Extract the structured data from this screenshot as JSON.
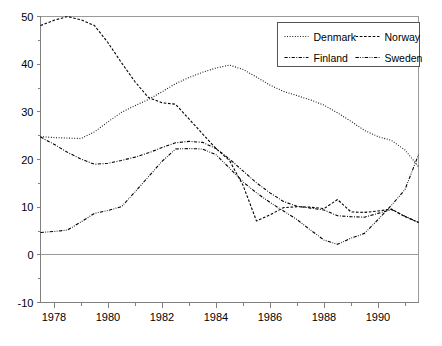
{
  "chart_data": {
    "type": "line",
    "title": "",
    "subtitle": "",
    "xlabel": "",
    "ylabel": "",
    "xlim": [
      1977.5,
      1991.5
    ],
    "ylim": [
      -10,
      50
    ],
    "yticks": [
      -10,
      0,
      10,
      20,
      30,
      40,
      50
    ],
    "ytick_labels": [
      "-10",
      "0",
      "10",
      "20",
      "30",
      "40",
      "50"
    ],
    "yminor_ticks": [
      -5,
      5,
      15,
      25,
      35,
      45
    ],
    "xticks": [
      1978,
      1979,
      1980,
      1981,
      1982,
      1983,
      1984,
      1985,
      1986,
      1987,
      1988,
      1989,
      1990,
      1991
    ],
    "xtick_labels_shown": [
      "1978",
      "1980",
      "1982",
      "1984",
      "1986",
      "1988",
      "1990"
    ],
    "xtick_labels_values": [
      1978,
      1980,
      1982,
      1984,
      1986,
      1988,
      1990
    ],
    "grid": false,
    "legend_position": "top-right",
    "zero_line": 0,
    "series": [
      {
        "name": "Denmark",
        "dash": "0.9 1.7",
        "x": [
          1977.5,
          1978.0,
          1978.5,
          1979.0,
          1979.5,
          1980.0,
          1980.5,
          1981.0,
          1981.5,
          1982.0,
          1982.5,
          1983.0,
          1983.5,
          1984.0,
          1984.5,
          1985.0,
          1985.5,
          1986.0,
          1986.5,
          1987.0,
          1987.5,
          1988.0,
          1988.5,
          1989.0,
          1989.5,
          1990.0,
          1990.5,
          1991.0,
          1991.5
        ],
        "values": [
          24.8,
          24.6,
          24.5,
          24.4,
          25.8,
          27.9,
          29.9,
          31.3,
          32.6,
          34.2,
          35.9,
          37.2,
          38.3,
          39.2,
          39.8,
          38.9,
          37.3,
          35.6,
          34.3,
          33.4,
          32.5,
          31.4,
          29.8,
          28.0,
          26.1,
          24.8,
          24.0,
          22.0,
          18.5
        ]
      },
      {
        "name": "Norway",
        "dash": "2.6 1.7",
        "x": [
          1977.5,
          1978.0,
          1978.5,
          1979.0,
          1979.5,
          1980.0,
          1980.5,
          1981.0,
          1981.5,
          1982.0,
          1982.5,
          1983.0,
          1983.5,
          1984.0,
          1984.5,
          1985.0,
          1985.5,
          1986.0,
          1986.5,
          1987.0,
          1987.5,
          1988.0,
          1988.5,
          1989.0,
          1989.5,
          1990.0,
          1990.5,
          1991.0,
          1991.5
        ],
        "values": [
          48.1,
          49.2,
          50.0,
          49.3,
          48.1,
          44.5,
          40.3,
          36.3,
          33.0,
          31.9,
          31.6,
          28.5,
          25.4,
          22.3,
          19.8,
          14.6,
          7.1,
          8.4,
          9.9,
          10.1,
          10.0,
          9.7,
          11.6,
          9.0,
          8.9,
          9.2,
          9.6,
          8.0,
          6.8
        ]
      },
      {
        "name": "Finland",
        "dash": "3.2 1.5 0.9 1.5",
        "x": [
          1977.5,
          1978.0,
          1978.5,
          1979.0,
          1979.5,
          1980.0,
          1980.5,
          1981.0,
          1981.5,
          1982.0,
          1982.5,
          1983.0,
          1983.5,
          1984.0,
          1984.5,
          1985.0,
          1985.5,
          1986.0,
          1986.5,
          1987.0,
          1987.5,
          1988.0,
          1988.5,
          1989.0,
          1989.5,
          1990.0,
          1990.5,
          1991.0,
          1991.5
        ],
        "values": [
          24.7,
          23.2,
          21.5,
          20.1,
          19.0,
          19.2,
          19.8,
          20.5,
          21.4,
          22.5,
          23.5,
          23.8,
          23.6,
          22.3,
          20.1,
          17.6,
          15.1,
          13.0,
          11.2,
          10.2,
          9.8,
          9.4,
          8.2,
          8.0,
          7.9,
          8.7,
          9.5,
          8.1,
          6.8
        ]
      },
      {
        "name": "Sweden",
        "dash": "3.4 1.4 0.8 1.4 0.8 1.4",
        "x": [
          1977.5,
          1978.0,
          1978.5,
          1979.0,
          1979.5,
          1980.0,
          1980.5,
          1981.0,
          1981.5,
          1982.0,
          1982.5,
          1983.0,
          1983.5,
          1984.0,
          1984.5,
          1985.0,
          1985.5,
          1986.0,
          1986.5,
          1987.0,
          1987.5,
          1988.0,
          1988.5,
          1989.0,
          1989.5,
          1990.0,
          1990.5,
          1991.0,
          1991.5
        ],
        "values": [
          4.7,
          4.9,
          5.2,
          6.9,
          8.7,
          9.3,
          10.1,
          13.2,
          16.4,
          19.6,
          22.2,
          22.3,
          22.2,
          21.0,
          18.2,
          15.3,
          13.0,
          11.0,
          9.2,
          7.4,
          5.2,
          3.1,
          2.2,
          3.5,
          4.5,
          7.4,
          10.4,
          13.7,
          21.0
        ]
      }
    ]
  },
  "legend": {
    "entries": [
      {
        "label": "Denmark"
      },
      {
        "label": "Norway"
      },
      {
        "label": "Finland"
      },
      {
        "label": "Sweden"
      }
    ]
  },
  "colors": {
    "line": "#000000",
    "axis": "#808080",
    "frame": "#9a9a9a",
    "background": "#ffffff",
    "legend_border": "#555555"
  }
}
